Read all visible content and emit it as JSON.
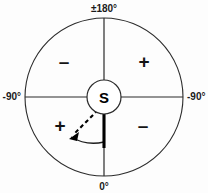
{
  "figure": {
    "kind": "polar-bearing-sign-convention-diagram",
    "center_letter": "S",
    "axis_labels": {
      "top": "±180°",
      "left": "-90°",
      "right": "-90°",
      "bottom": "0°"
    },
    "quadrant_signs": {
      "upper_left": "–",
      "upper_right": "+",
      "lower_left": "+",
      "lower_right": "–"
    },
    "colors": {
      "background": "#fdfdfd",
      "stroke": "#2b2b2b",
      "bold_stroke": "#000000",
      "text": "#141414"
    },
    "geometry": {
      "center_x": 104,
      "center_y": 97,
      "outer_radius": 79,
      "inner_radius": 17,
      "reference_bearing_deg": 0,
      "measured_bearing_deg": 228,
      "sweep_arc_radius": 45
    }
  }
}
